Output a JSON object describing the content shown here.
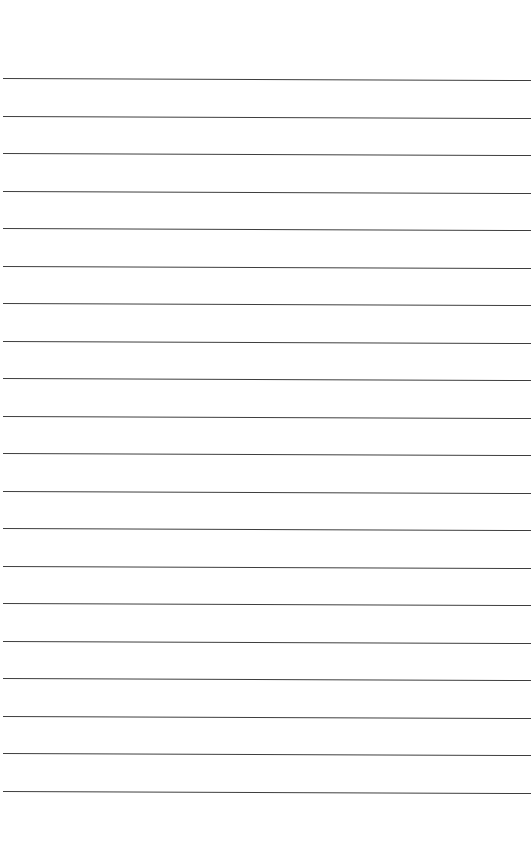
{
  "page": {
    "type": "lined-paper",
    "background": "#ffffff",
    "line_color": "#3e3e3e",
    "line_count": 20,
    "first_line_y": 78,
    "line_spacing": 37.5,
    "slope_deg": 0.22
  }
}
